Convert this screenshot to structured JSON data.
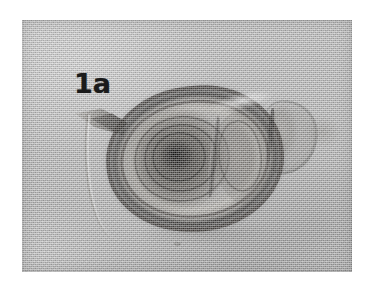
{
  "figure": {
    "label": "1a",
    "caption": "",
    "plate": {
      "kind": "grayscale-photomicrograph",
      "background_color": "#b4b4b4",
      "page_color": "#ffffff",
      "ink_color": "#1b1b1b",
      "bounds": {
        "x": 22,
        "y": 20,
        "width": 330,
        "height": 252
      }
    },
    "specimen": {
      "name": "parasite-egg",
      "structures": [
        {
          "name": "outer-shell",
          "tone": "dark-rim"
        },
        {
          "name": "shell-gap",
          "tone": "bright"
        },
        {
          "name": "inner-membrane",
          "tone": "dark-line"
        },
        {
          "name": "embryo-mass",
          "tone": "dark"
        },
        {
          "name": "concentric-swirls",
          "tone": "mid-dark"
        },
        {
          "name": "embryo-core",
          "tone": "darkest"
        },
        {
          "name": "right-lobe",
          "tone": "mid-gray"
        },
        {
          "name": "operculum-knob",
          "tone": "light-gray"
        },
        {
          "name": "left-spine",
          "tone": "mid-gray"
        },
        {
          "name": "trailing-filament",
          "tone": "faint"
        },
        {
          "name": "debris-speck",
          "tone": "faint"
        }
      ]
    }
  }
}
